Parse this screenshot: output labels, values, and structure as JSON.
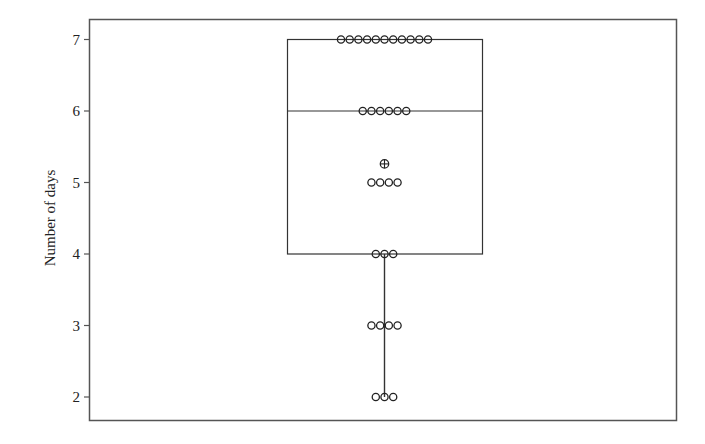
{
  "chart_data": {
    "type": "boxplot",
    "title": "",
    "xlabel": "",
    "ylabel": "Number of days",
    "ylim": [
      1.7,
      7.3
    ],
    "yticks": [
      2,
      3,
      4,
      5,
      6,
      7
    ],
    "grid": false,
    "legend": null,
    "box": {
      "q1": 4,
      "median": 6,
      "q3": 7,
      "whisker_low": 2,
      "whisker_high": 7,
      "mean": 5.26
    },
    "points": [
      {
        "value": 7,
        "count": 11
      },
      {
        "value": 6,
        "count": 6
      },
      {
        "value": 5,
        "count": 4
      },
      {
        "value": 4,
        "count": 3
      },
      {
        "value": 3,
        "count": 4
      },
      {
        "value": 2,
        "count": 3
      }
    ],
    "n": 31,
    "colors": {
      "line": "#333333",
      "frame": "#555555",
      "point": "#222222"
    }
  }
}
